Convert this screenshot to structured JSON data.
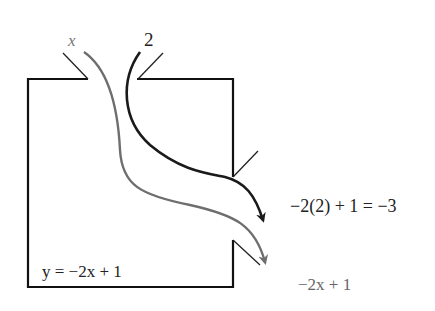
{
  "diagram": {
    "input_labels": {
      "variable": "x",
      "number": "2"
    },
    "function_label": "y = −2x + 1",
    "output_labels": {
      "evaluated": "−2(2) + 1 = −3",
      "expression": "−2x + 1"
    },
    "colors": {
      "box": "#111111",
      "number_path": "#1a1a1a",
      "variable_path": "#6e6e6e",
      "variable_text": "#777777",
      "expression_text": "#666666"
    }
  }
}
